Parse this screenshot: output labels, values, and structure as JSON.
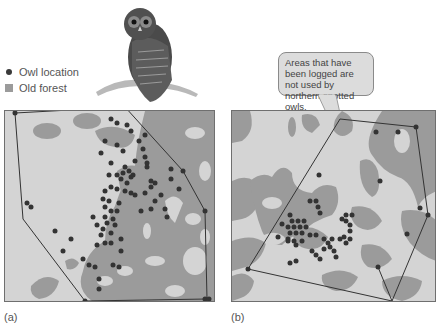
{
  "legend": {
    "items": [
      {
        "icon": "dot-icon",
        "label": "Owl location",
        "color": "#3a3a3a"
      },
      {
        "icon": "square-icon",
        "label": "Old forest",
        "color": "#9b9b9b"
      }
    ]
  },
  "illustration": {
    "subject": "northern spotted owl perched on branch"
  },
  "callout": {
    "text": "Areas that have been logged are not used by northern spotted owls."
  },
  "panels": [
    {
      "id": "a",
      "caption": "(a)"
    },
    {
      "id": "b",
      "caption": "(b)"
    }
  ],
  "colors": {
    "non_forest": "#d4d4d4",
    "old_forest": "#9b9b9b",
    "owl_dot": "#333333",
    "boundary_line": "#333333",
    "callout_fill": "#dcdcdc"
  }
}
